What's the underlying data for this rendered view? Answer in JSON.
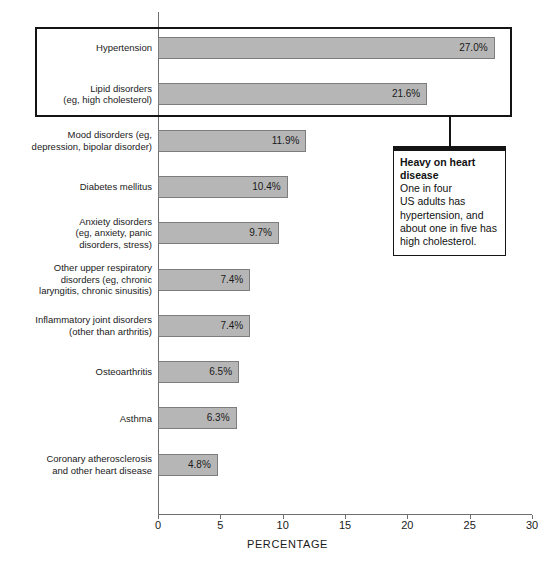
{
  "chart_data": {
    "type": "bar",
    "orientation": "horizontal",
    "title": "",
    "xlabel": "PERCENTAGE",
    "ylabel": "",
    "xlim": [
      0,
      30
    ],
    "xticks": [
      0,
      5,
      10,
      15,
      20,
      25,
      30
    ],
    "xtick_labels": [
      "0",
      "5",
      "10",
      "15",
      "20",
      "25",
      "30"
    ],
    "grid": false,
    "legend": null,
    "bar_color": "#b6b6b6",
    "bar_border_color": "#7d7d7d",
    "categories": [
      "Hypertension",
      "Lipid disorders\n(eg, high cholesterol)",
      "Mood disorders (eg,\ndepression, bipolar disorder)",
      "Diabetes mellitus",
      "Anxiety disorders\n(eg, anxiety, panic\ndisorders, stress)",
      "Other upper respiratory\ndisorders (eg, chronic\nlaryngitis, chronic sinusitis)",
      "Inflammatory joint disorders\n(other than arthritis)",
      "Osteoarthritis",
      "Asthma",
      "Coronary atherosclerosis\nand other heart disease"
    ],
    "values": [
      27.0,
      21.6,
      11.9,
      10.4,
      9.7,
      7.4,
      7.4,
      6.5,
      6.3,
      4.8
    ],
    "value_labels": [
      "27.0%",
      "21.6%",
      "11.9%",
      "10.4%",
      "9.7%",
      "7.4%",
      "7.4%",
      "6.5%",
      "6.3%",
      "4.8%"
    ]
  },
  "annotations": {
    "highlight_box": {
      "name": "top-two-highlight",
      "covers": [
        "Hypertension",
        "Lipid disorders (eg, high cholesterol)"
      ]
    },
    "callout": {
      "title": "Heavy on heart disease",
      "body": "One in four\nUS adults has\nhypertension, and\nabout one in five has\nhigh cholesterol."
    }
  }
}
